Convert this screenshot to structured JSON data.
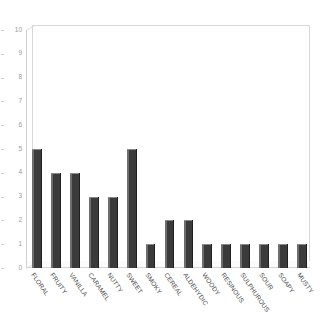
{
  "chart_data": {
    "type": "bar",
    "title": "",
    "subtitle": "",
    "xlabel": "",
    "ylabel": "",
    "ylim": [
      0,
      10
    ],
    "grid": false,
    "legend": null,
    "legend_position": "none",
    "y_ticks": [
      0,
      1,
      2,
      3,
      4,
      5,
      6,
      7,
      8,
      9,
      10
    ],
    "y_tick_labels": [
      "0",
      "1",
      "2",
      "3",
      "4",
      "5",
      "6",
      "7",
      "8",
      "9",
      "10"
    ],
    "categories": [
      "FLORAL",
      "FRUITY",
      "VANILLA",
      "CARAMEL",
      "NUTTY",
      "SWEET",
      "SMOKY",
      "CEREAL",
      "ALDEHYDIC",
      "WOODY",
      "RESINOUS",
      "SULPHUROUS",
      "SOUR",
      "SOAPY",
      "MUSTY"
    ],
    "values": [
      5,
      4,
      4,
      3,
      3,
      5,
      1,
      2,
      2,
      1,
      1,
      1,
      1,
      1,
      1
    ],
    "bar_color": "#3b3b3b",
    "axis_color": "#d0d0d0",
    "tick_label_color": "#9a9a9a",
    "category_label_color": "#4a4a4a"
  }
}
